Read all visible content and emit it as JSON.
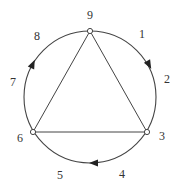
{
  "diagram": {
    "type": "circle-with-inscribed-triangle",
    "stroke_color": "#444444",
    "circle": {
      "cx": 90,
      "cy": 97,
      "r": 66
    },
    "nodes": [
      {
        "id": "9",
        "x": 90,
        "y": 31
      },
      {
        "id": "3",
        "x": 147,
        "y": 132
      },
      {
        "id": "6",
        "x": 33,
        "y": 132
      }
    ],
    "edges": [
      {
        "from": "9",
        "to": "3"
      },
      {
        "from": "3",
        "to": "6"
      },
      {
        "from": "6",
        "to": "9"
      }
    ],
    "arrows": [
      {
        "position": "between-1-and-2",
        "direction": "clockwise"
      },
      {
        "position": "between-4-and-5",
        "direction": "clockwise"
      },
      {
        "position": "between-7-and-8",
        "direction": "clockwise"
      }
    ],
    "labels": [
      {
        "text": "9",
        "x": 90,
        "y": 15
      },
      {
        "text": "1",
        "x": 142,
        "y": 34
      },
      {
        "text": "2",
        "x": 167,
        "y": 79
      },
      {
        "text": "3",
        "x": 162,
        "y": 136
      },
      {
        "text": "4",
        "x": 122,
        "y": 174
      },
      {
        "text": "5",
        "x": 60,
        "y": 175
      },
      {
        "text": "6",
        "x": 20,
        "y": 138
      },
      {
        "text": "7",
        "x": 13,
        "y": 82
      },
      {
        "text": "8",
        "x": 37,
        "y": 36
      }
    ]
  }
}
